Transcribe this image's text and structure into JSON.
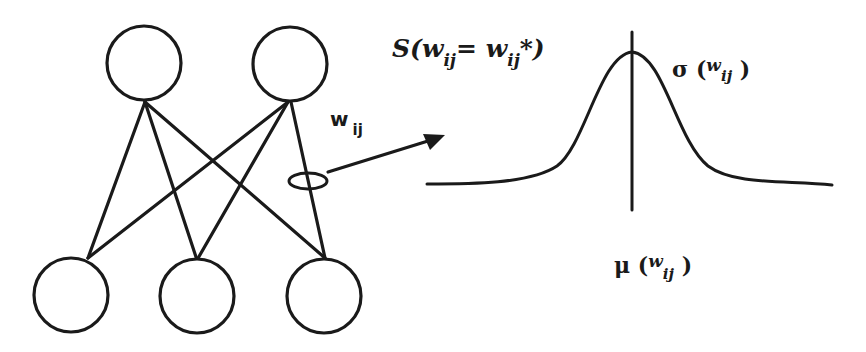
{
  "diagram": {
    "network": {
      "input_layer_nodes": 3,
      "output_layer_nodes": 2,
      "connection_label": "w",
      "connection_label_sub": "ij"
    },
    "distribution": {
      "type": "gaussian",
      "s_label": {
        "prefix": "S(w",
        "sub1": "ij",
        "middle": "= w",
        "sub2": "ij",
        "suffix": "*)"
      },
      "sigma_label": {
        "symbol": "σ (",
        "var": "w",
        "sub": "ij",
        "close": ")"
      },
      "mu_label": {
        "symbol": "μ (",
        "var": "w",
        "sub": "ij",
        "close": ")"
      }
    },
    "colors": {
      "stroke": "#1a1a1a",
      "background": "#ffffff"
    }
  }
}
